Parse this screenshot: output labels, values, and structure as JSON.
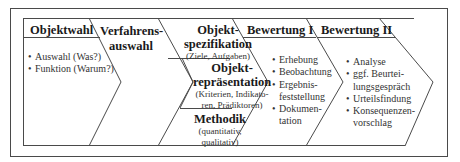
{
  "diagram": {
    "stages": [
      {
        "id": "objektwahl",
        "title": "Objektwahl",
        "items": [
          "Auswahl (Was?)",
          "Funktion (Warum?)"
        ]
      },
      {
        "id": "verfahrensauswahl",
        "title_lines": [
          "Verfahrens-",
          "auswahl"
        ]
      },
      {
        "id": "verfahren_sub",
        "parts": [
          {
            "title_lines": [
              "Objekt-",
              "spezifikation"
            ],
            "sub_lines": [
              "(Ziele, Aufgaben)"
            ]
          },
          {
            "title_lines": [
              "Objekt-",
              "repräsentation"
            ],
            "sub_lines": [
              "(Kriterien, Indikato-",
              "ren, Prädiktoren)"
            ]
          },
          {
            "title_lines": [
              "Methodik"
            ],
            "sub_lines": [
              "(quantitativ,",
              "qualitativ)"
            ]
          }
        ]
      },
      {
        "id": "bewertung1",
        "title": "Bewertung I",
        "items": [
          "Erhebung",
          "Beobachtung",
          "Ergebnis-\nfeststellung",
          "Dokumen-\ntation"
        ],
        "item_lines": [
          [
            "Erhebung"
          ],
          [
            "Beobachtung"
          ],
          [
            "Ergebnis-",
            "feststellung"
          ],
          [
            "Dokumen-",
            "tation"
          ]
        ]
      },
      {
        "id": "bewertung2",
        "title": "Bewertung II",
        "item_lines": [
          [
            "Analyse"
          ],
          [
            "ggf. Beurtei-",
            "lungsgespräch"
          ],
          [
            "Urteilsfindung"
          ],
          [
            "Konsequenzen-",
            "vorschlag"
          ]
        ]
      }
    ],
    "colors": {
      "line": "#444444",
      "text": "#222222",
      "background": "#ffffff"
    }
  }
}
